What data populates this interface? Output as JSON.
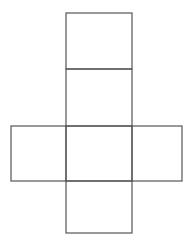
{
  "diagram": {
    "type": "cube-net",
    "stroke_color": "#555555",
    "background": "#ffffff",
    "faces": [
      {
        "name": "top-face",
        "x": 66,
        "y": 13,
        "w": 66,
        "h": 56
      },
      {
        "name": "upper-middle-face",
        "x": 66,
        "y": 69,
        "w": 66,
        "h": 57
      },
      {
        "name": "left-face",
        "x": 11,
        "y": 126,
        "w": 55,
        "h": 55
      },
      {
        "name": "center-face",
        "x": 66,
        "y": 126,
        "w": 66,
        "h": 55
      },
      {
        "name": "right-face",
        "x": 132,
        "y": 126,
        "w": 50,
        "h": 55
      },
      {
        "name": "bottom-face",
        "x": 66,
        "y": 181,
        "w": 66,
        "h": 52
      }
    ]
  }
}
